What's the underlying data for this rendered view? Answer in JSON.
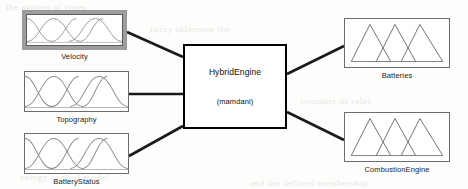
{
  "diagram": {
    "type": "fuzzy-inference-system",
    "engine": {
      "name": "HybridEngine",
      "inference_type": "(mamdani)"
    },
    "inputs": [
      {
        "label": "Velocity",
        "mf_shape": "bell",
        "mf_count": 3,
        "selected": true
      },
      {
        "label": "Topography",
        "mf_shape": "bell",
        "mf_count": 3,
        "selected": false
      },
      {
        "label": "BatteryStatus",
        "mf_shape": "bell",
        "mf_count": 3,
        "selected": false
      }
    ],
    "outputs": [
      {
        "label": "Batteries",
        "mf_shape": "triangle",
        "mf_count": 3
      },
      {
        "label": "CombustionEngine",
        "mf_shape": "triangle",
        "mf_count": 3
      }
    ],
    "colors": {
      "line": "#1a1a1a",
      "box_border": "#6d6d6d",
      "engine_border": "#000000",
      "selection": "#9d9d9d",
      "curve": "#8a8a8a",
      "background": "#fdfdfc"
    },
    "bleed_text": [
      "the  system  of  types",
      "fuzzy  inference  the",
      "structure  of  rules",
      "energy  control  model",
      "and  the  defined  membership"
    ]
  }
}
